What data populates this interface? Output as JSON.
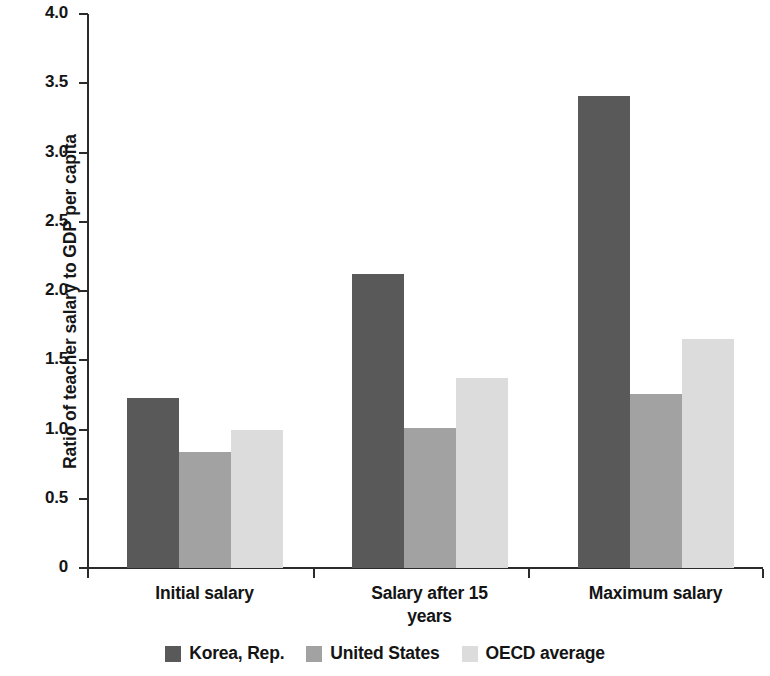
{
  "chart_data": {
    "type": "bar",
    "title": "",
    "subtitle": "",
    "xlabel": "",
    "ylabel": "Ratio of teacher salary to GDP per capita",
    "ylim": [
      0,
      4.0
    ],
    "yticks": [
      "0",
      "0.5",
      "1.0",
      "1.5",
      "2.0",
      "2.5",
      "3.0",
      "3.5",
      "4.0"
    ],
    "ytick_values": [
      0,
      0.5,
      1.0,
      1.5,
      2.0,
      2.5,
      3.0,
      3.5,
      4.0
    ],
    "grid": false,
    "legend_position": "bottom",
    "categories": [
      "Initial salary",
      "Salary after 15 years",
      "Maximum salary"
    ],
    "category_lines": [
      [
        "Initial salary"
      ],
      [
        "Salary after 15",
        "years"
      ],
      [
        "Maximum salary"
      ]
    ],
    "series": [
      {
        "name": "Korea, Rep.",
        "color": "#595959",
        "values": [
          1.23,
          2.12,
          3.41
        ]
      },
      {
        "name": "United States",
        "color": "#a2a2a2",
        "values": [
          0.84,
          1.01,
          1.26
        ]
      },
      {
        "name": "OECD average",
        "color": "#dcdcdc",
        "values": [
          1.0,
          1.37,
          1.65
        ]
      }
    ]
  },
  "legend": {
    "items": [
      {
        "label": "Korea, Rep."
      },
      {
        "label": "United States"
      },
      {
        "label": "OECD average"
      }
    ]
  },
  "axis": {
    "y_title": "Ratio of teacher salary to GDP per capita",
    "tick_labels": [
      "4.0",
      "3.5",
      "3.0",
      "2.5",
      "2.0",
      "1.5",
      "1.0",
      "0.5",
      "0"
    ]
  },
  "colors": {
    "korea": "#595959",
    "united_states": "#a2a2a2",
    "oecd_average": "#dcdcdc",
    "axis": "#2b2b2b",
    "text": "#141414",
    "background": "#ffffff"
  }
}
